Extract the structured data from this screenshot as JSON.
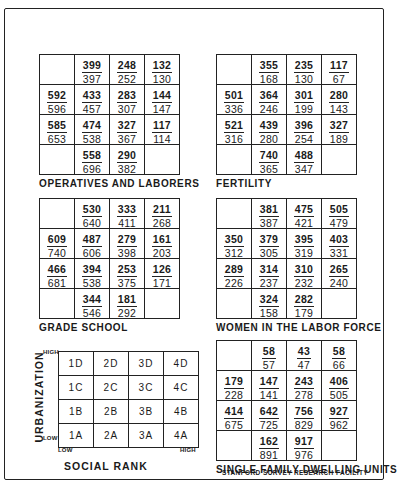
{
  "footer": "STANFORD SURVEY RESEARCH FACILITY",
  "key": {
    "title": "SOCIAL RANK",
    "y_axis": "URBANIZATION",
    "y_high": "HIGH",
    "y_low": "LOW",
    "x_low": "LOW",
    "x_high": "HIGH",
    "rows": [
      [
        "1D",
        "2D",
        "3D",
        "4D"
      ],
      [
        "1C",
        "2C",
        "3C",
        "4C"
      ],
      [
        "1B",
        "2B",
        "3B",
        "4B"
      ],
      [
        "1A",
        "2A",
        "3A",
        "4A"
      ]
    ]
  },
  "panels": [
    {
      "title": "OPERATIVES AND LABORERS",
      "rows": [
        [
          null,
          {
            "top": "399",
            "bottom": "397"
          },
          {
            "top": "248",
            "bottom": "252"
          },
          {
            "top": "132",
            "bottom": "130"
          }
        ],
        [
          {
            "top": "592",
            "bottom": "596"
          },
          {
            "top": "433",
            "bottom": "457"
          },
          {
            "top": "283",
            "bottom": "307"
          },
          {
            "top": "144",
            "bottom": "147"
          }
        ],
        [
          {
            "top": "585",
            "bottom": "653"
          },
          {
            "top": "474",
            "bottom": "538"
          },
          {
            "top": "327",
            "bottom": "367"
          },
          {
            "top": "117",
            "bottom": "114"
          }
        ],
        [
          null,
          {
            "top": "558",
            "bottom": "696"
          },
          {
            "top": "290",
            "bottom": "382"
          },
          null
        ]
      ]
    },
    {
      "title": "FERTILITY",
      "rows": [
        [
          null,
          {
            "top": "355",
            "bottom": "168"
          },
          {
            "top": "235",
            "bottom": "130"
          },
          {
            "top": "117",
            "bottom": "67"
          }
        ],
        [
          {
            "top": "501",
            "bottom": "336"
          },
          {
            "top": "364",
            "bottom": "246"
          },
          {
            "top": "301",
            "bottom": "199"
          },
          {
            "top": "280",
            "bottom": "143"
          }
        ],
        [
          {
            "top": "521",
            "bottom": "316"
          },
          {
            "top": "439",
            "bottom": "280"
          },
          {
            "top": "396",
            "bottom": "254"
          },
          {
            "top": "327",
            "bottom": "189"
          }
        ],
        [
          null,
          {
            "top": "740",
            "bottom": "365"
          },
          {
            "top": "488",
            "bottom": "347"
          },
          null
        ]
      ]
    },
    {
      "title": "GRADE SCHOOL",
      "rows": [
        [
          null,
          {
            "top": "530",
            "bottom": "640"
          },
          {
            "top": "333",
            "bottom": "411"
          },
          {
            "top": "211",
            "bottom": "268"
          }
        ],
        [
          {
            "top": "609",
            "bottom": "740"
          },
          {
            "top": "487",
            "bottom": "606"
          },
          {
            "top": "279",
            "bottom": "398"
          },
          {
            "top": "161",
            "bottom": "203"
          }
        ],
        [
          {
            "top": "466",
            "bottom": "681"
          },
          {
            "top": "394",
            "bottom": "538"
          },
          {
            "top": "253",
            "bottom": "375"
          },
          {
            "top": "126",
            "bottom": "171"
          }
        ],
        [
          null,
          {
            "top": "344",
            "bottom": "546"
          },
          {
            "top": "181",
            "bottom": "292"
          },
          null
        ]
      ]
    },
    {
      "title": "WOMEN IN THE LABOR FORCE",
      "rows": [
        [
          null,
          {
            "top": "381",
            "bottom": "387"
          },
          {
            "top": "475",
            "bottom": "421"
          },
          {
            "top": "505",
            "bottom": "479"
          }
        ],
        [
          {
            "top": "350",
            "bottom": "312"
          },
          {
            "top": "379",
            "bottom": "305"
          },
          {
            "top": "395",
            "bottom": "319"
          },
          {
            "top": "403",
            "bottom": "331"
          }
        ],
        [
          {
            "top": "289",
            "bottom": "226"
          },
          {
            "top": "314",
            "bottom": "237"
          },
          {
            "top": "310",
            "bottom": "232"
          },
          {
            "top": "265",
            "bottom": "240"
          }
        ],
        [
          null,
          {
            "top": "324",
            "bottom": "158"
          },
          {
            "top": "282",
            "bottom": "179"
          },
          null
        ]
      ]
    },
    {
      "title": "SINGLE FAMILY DWELLING UNITS",
      "rows": [
        [
          null,
          {
            "top": "58",
            "bottom": "57"
          },
          {
            "top": "43",
            "bottom": "47"
          },
          {
            "top": "58",
            "bottom": "66"
          }
        ],
        [
          {
            "top": "179",
            "bottom": "228"
          },
          {
            "top": "147",
            "bottom": "141"
          },
          {
            "top": "243",
            "bottom": "278"
          },
          {
            "top": "406",
            "bottom": "505"
          }
        ],
        [
          {
            "top": "414",
            "bottom": "675"
          },
          {
            "top": "642",
            "bottom": "725"
          },
          {
            "top": "756",
            "bottom": "829"
          },
          {
            "top": "927",
            "bottom": "962"
          }
        ],
        [
          null,
          {
            "top": "162",
            "bottom": "891"
          },
          {
            "top": "917",
            "bottom": "976"
          },
          null
        ]
      ]
    }
  ]
}
